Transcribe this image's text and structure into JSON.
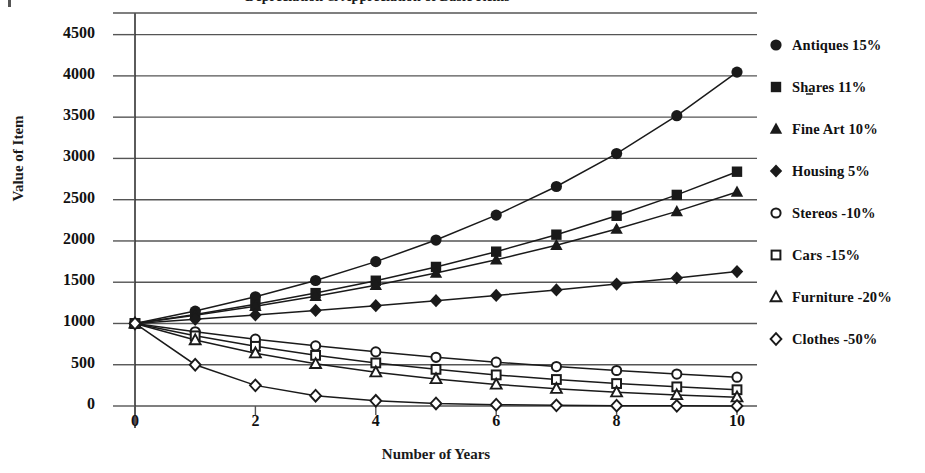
{
  "chart_data": {
    "type": "line",
    "title": "Depreciation & Appreciation of Basic Items",
    "subtitle": "",
    "xlabel": "Number of Years",
    "ylabel": "Value of Item",
    "xlim": [
      0,
      10
    ],
    "ylim": [
      0,
      4750
    ],
    "xticks": [
      0,
      2,
      4,
      6,
      8,
      10
    ],
    "xticklabels": [
      "0",
      "2",
      "4",
      "6",
      "8",
      "10"
    ],
    "yticks": [
      0,
      500,
      1000,
      1500,
      2000,
      2500,
      3000,
      3500,
      4000,
      4500
    ],
    "yticklabels": [
      "0",
      "500",
      "1000",
      "1500",
      "2000",
      "2500",
      "3000",
      "3500",
      "4000",
      "4500"
    ],
    "grid": "horizontal",
    "legend_position": "right",
    "x": [
      0,
      1,
      2,
      3,
      4,
      5,
      6,
      7,
      8,
      9,
      10
    ],
    "series": [
      {
        "name": "Antiques 15%",
        "rate": 15,
        "marker": "filled-circle",
        "values": [
          1000,
          1150,
          1323,
          1521,
          1749,
          2011,
          2313,
          2660,
          3059,
          3518,
          4046
        ]
      },
      {
        "name": "Shares 11%",
        "rate": 11,
        "marker": "filled-square",
        "values": [
          1000,
          1110,
          1232,
          1368,
          1518,
          1685,
          1870,
          2076,
          2305,
          2558,
          2839
        ]
      },
      {
        "name": "Fine Art 10%",
        "rate": 10,
        "marker": "filled-triangle",
        "values": [
          1000,
          1100,
          1210,
          1331,
          1464,
          1611,
          1772,
          1949,
          2144,
          2358,
          2594
        ]
      },
      {
        "name": "Housing 5%",
        "rate": 5,
        "marker": "filled-diamond",
        "values": [
          1000,
          1050,
          1103,
          1158,
          1216,
          1276,
          1340,
          1407,
          1477,
          1551,
          1629
        ]
      },
      {
        "name": "Stereos -10%",
        "rate": -10,
        "marker": "open-circle",
        "values": [
          1000,
          900,
          810,
          729,
          656,
          590,
          531,
          478,
          430,
          387,
          349
        ]
      },
      {
        "name": "Cars -15%",
        "rate": -15,
        "marker": "open-square",
        "values": [
          1000,
          850,
          723,
          614,
          522,
          444,
          377,
          321,
          272,
          232,
          197
        ]
      },
      {
        "name": "Furniture -20%",
        "rate": -20,
        "marker": "open-triangle",
        "values": [
          1000,
          800,
          640,
          512,
          410,
          328,
          262,
          210,
          168,
          134,
          107
        ]
      },
      {
        "name": "Clothes -50%",
        "rate": -50,
        "marker": "open-diamond",
        "values": [
          1000,
          500,
          250,
          125,
          63,
          31,
          16,
          8,
          4,
          2,
          1
        ]
      }
    ],
    "colors": {
      "line": "#1a1a1a",
      "grid": "#555555",
      "axis": "#333333",
      "text": "#111111",
      "background": "#ffffff"
    }
  },
  "legend": {
    "items": [
      {
        "label": "Antiques 15%",
        "marker": "filled-circle"
      },
      {
        "label": "Shares 11%",
        "marker": "filled-square"
      },
      {
        "label": "Fine Art 10%",
        "marker": "filled-triangle"
      },
      {
        "label": "Housing 5%",
        "marker": "filled-diamond"
      },
      {
        "label": "Stereos -10%",
        "marker": "open-circle"
      },
      {
        "label": "Cars -15%",
        "marker": "open-square"
      },
      {
        "label": "Furniture -20%",
        "marker": "open-triangle"
      },
      {
        "label": "Clothes -50%",
        "marker": "open-diamond"
      }
    ]
  }
}
